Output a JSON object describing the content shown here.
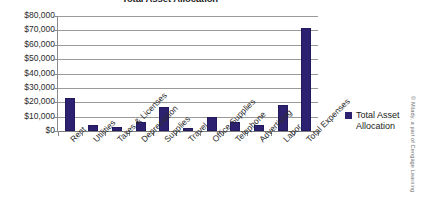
{
  "chart_data": {
    "type": "bar",
    "title": "Total Asset Allocation",
    "xlabel": "",
    "ylabel": "",
    "ylim": [
      0,
      80000
    ],
    "grid": true,
    "legend_position": "right",
    "categories": [
      "Rent",
      "Utilities",
      "Taxes & Licenses",
      "Depreciation",
      "Supplies",
      "Travel",
      "Office Supplies",
      "Telephone",
      "Advertising",
      "Labor",
      "Total Expenses"
    ],
    "values": [
      23000,
      4000,
      3000,
      6000,
      17000,
      2000,
      10000,
      6000,
      4000,
      18000,
      72000
    ],
    "series": [
      {
        "name": "Total Asset Allocation",
        "color": "#2b2170",
        "values": [
          23000,
          4000,
          3000,
          6000,
          17000,
          2000,
          10000,
          6000,
          4000,
          18000,
          72000
        ]
      }
    ],
    "y_ticks": [
      "$80,000",
      "$70,000",
      "$60,000",
      "$50,000",
      "$40,000",
      "$30,000",
      "$20,000",
      "$10,000",
      "$0"
    ],
    "y_tick_values": [
      80000,
      70000,
      60000,
      50000,
      40000,
      30000,
      20000,
      10000,
      0
    ]
  },
  "legend": {
    "label": "Total Asset Allocation",
    "swatch_color": "#2b2170"
  },
  "credit": {
    "text": "© Milady, a part of Cengage Learning"
  },
  "colors": {
    "bar": "#2b2170",
    "gridline": "#9a9a9a",
    "axis": "#8a8a8a",
    "text": "#2b2b2b",
    "background": "#ffffff"
  }
}
